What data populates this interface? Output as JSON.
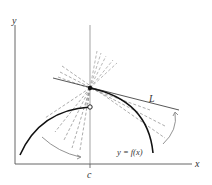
{
  "diagram": {
    "axes": {
      "x_label": "x",
      "y_label": "y",
      "c_label": "c"
    },
    "tangent_label": "L",
    "curve_label": "y = f(x)",
    "colors": {
      "axis": "#555555",
      "curve": "#111111",
      "tangent": "#444444",
      "secant_dashed": "#888888",
      "arrow": "#777777"
    }
  }
}
